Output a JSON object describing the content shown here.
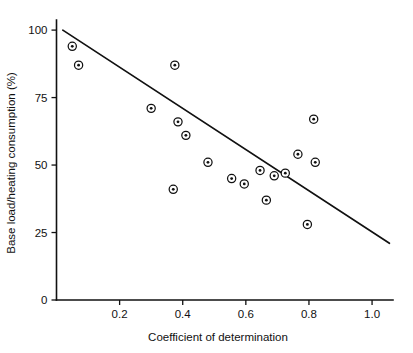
{
  "chart_data": {
    "type": "scatter",
    "title": "",
    "xlabel": "Coefficient of determination",
    "ylabel": "Base load/heating consumption (%)",
    "xlim": [
      0.0,
      1.06
    ],
    "ylim": [
      0,
      103
    ],
    "xticks": [
      0.2,
      0.4,
      0.6,
      0.8,
      1.0
    ],
    "xticklabels": [
      "0.2",
      "0.4",
      "0.6",
      "0.8",
      "1.0"
    ],
    "yticks": [
      0,
      25,
      50,
      75,
      100
    ],
    "yticklabels": [
      "0",
      "25",
      "50",
      "75",
      "100"
    ],
    "grid": false,
    "legend": null,
    "marker_style": "bullseye-open-circle-with-dot",
    "points": [
      {
        "x": 0.05,
        "y": 94
      },
      {
        "x": 0.07,
        "y": 87
      },
      {
        "x": 0.3,
        "y": 71
      },
      {
        "x": 0.375,
        "y": 87
      },
      {
        "x": 0.385,
        "y": 66
      },
      {
        "x": 0.41,
        "y": 61
      },
      {
        "x": 0.37,
        "y": 41
      },
      {
        "x": 0.48,
        "y": 51
      },
      {
        "x": 0.555,
        "y": 45
      },
      {
        "x": 0.595,
        "y": 43
      },
      {
        "x": 0.645,
        "y": 48
      },
      {
        "x": 0.665,
        "y": 37
      },
      {
        "x": 0.69,
        "y": 46
      },
      {
        "x": 0.725,
        "y": 47
      },
      {
        "x": 0.765,
        "y": 54
      },
      {
        "x": 0.795,
        "y": 28
      },
      {
        "x": 0.815,
        "y": 67
      },
      {
        "x": 0.82,
        "y": 51
      }
    ],
    "fit_line": {
      "label": "regression line",
      "x_start": 0.02,
      "y_start": 100,
      "x_end": 1.055,
      "y_end": 21
    }
  }
}
